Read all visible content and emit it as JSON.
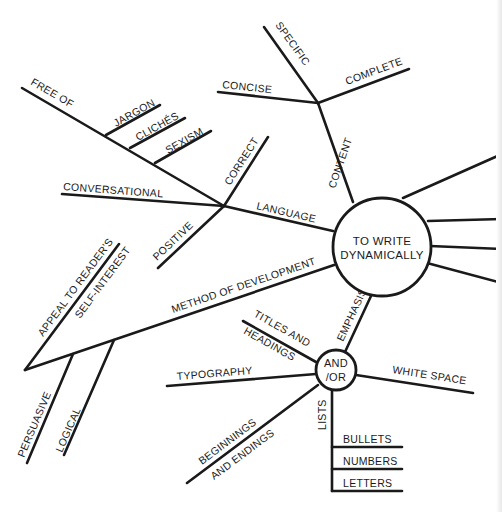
{
  "diagram": {
    "type": "mind-map",
    "center": {
      "label_line1": "TO WRITE",
      "label_line2": "DYNAMICALLY"
    },
    "branches": {
      "content": {
        "label": "CONTENT",
        "children": [
          "SPECIFIC",
          "CONCISE",
          "COMPLETE"
        ]
      },
      "language": {
        "label": "LANGUAGE",
        "children": [
          "FREE OF",
          "CONVERSATIONAL",
          "CORRECT",
          "POSITIVE"
        ],
        "free_of_children": [
          "JARGON",
          "CLICHÉS",
          "SEXISM"
        ]
      },
      "method_of_development": {
        "label": "METHOD OF DEVELOPMENT",
        "children": [
          "PERSUASIVE",
          "LOGICAL"
        ],
        "appeal": {
          "line1": "APPEAL TO READER'S",
          "line2": "SELF-INTEREST"
        }
      },
      "emphasis": {
        "label": "EMPHASIS",
        "hub": {
          "line1": "AND",
          "line2": "/OR"
        },
        "children": {
          "titles": {
            "line1": "TITLES AND",
            "line2": "HEADINGS"
          },
          "typography": "TYPOGRAPHY",
          "white_space": "WHITE SPACE",
          "beginnings": {
            "line1": "BEGINNINGS",
            "line2": "AND ENDINGS"
          },
          "lists": {
            "label": "LISTS",
            "items": [
              "BULLETS",
              "NUMBERS",
              "LETTERS"
            ]
          }
        }
      },
      "unlabeled_right_branches": 4
    }
  }
}
